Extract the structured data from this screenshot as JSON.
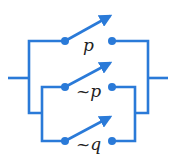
{
  "diagram": {
    "type": "switching-circuit",
    "color": "#2a7ad8",
    "switches": [
      {
        "label": "p",
        "state": "open"
      },
      {
        "label": "~p",
        "state": "open"
      },
      {
        "label": "~q",
        "state": "open"
      }
    ],
    "topology": "p in parallel with (~p in parallel with ~q)"
  }
}
